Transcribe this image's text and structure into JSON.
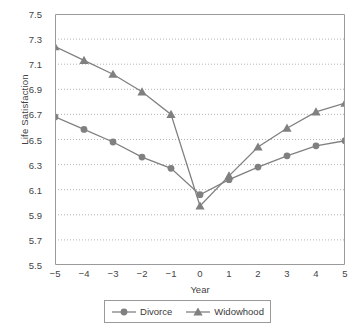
{
  "chart_data": {
    "type": "line",
    "title": "",
    "xlabel": "Year",
    "ylabel": "Life Satisfaction",
    "x": [
      -5,
      -4,
      -3,
      -2,
      -1,
      0,
      1,
      2,
      3,
      4,
      5
    ],
    "xtick_labels": [
      "−5",
      "−4",
      "−3",
      "−2",
      "−1",
      "0",
      "1",
      "2",
      "3",
      "4",
      "5"
    ],
    "ytick_labels": [
      "7.5",
      "7.3",
      "7.1",
      "6.9",
      "6.7",
      "6.5",
      "6.3",
      "6.1",
      "5.9",
      "5.7",
      "5.5"
    ],
    "yticks": [
      7.5,
      7.3,
      7.1,
      6.9,
      6.7,
      6.5,
      6.3,
      6.1,
      5.9,
      5.7,
      5.5
    ],
    "xlim": [
      -5,
      5
    ],
    "ylim": [
      5.5,
      7.5
    ],
    "grid": "horizontal-dotted",
    "legend_position": "bottom",
    "series": [
      {
        "name": "Divorce",
        "marker": "circle",
        "color": "#808080",
        "values": [
          6.68,
          6.58,
          6.48,
          6.36,
          6.27,
          6.06,
          6.18,
          6.28,
          6.37,
          6.45,
          6.49
        ]
      },
      {
        "name": "Widowhood",
        "marker": "triangle",
        "color": "#808080",
        "values": [
          7.24,
          7.13,
          7.02,
          6.88,
          6.7,
          5.97,
          6.21,
          6.44,
          6.59,
          6.72,
          6.79
        ]
      }
    ]
  },
  "legend": {
    "items": [
      {
        "label": "Divorce",
        "marker": "circle-marker-icon"
      },
      {
        "label": "Widowhood",
        "marker": "triangle-marker-icon"
      }
    ]
  }
}
